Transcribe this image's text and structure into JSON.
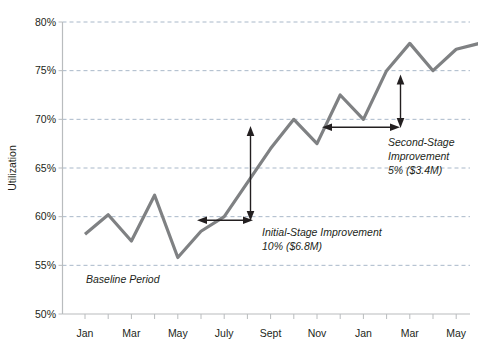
{
  "chart_data": {
    "type": "line",
    "title": "",
    "xlabel": "",
    "ylabel": "Utilization",
    "ylim": [
      50,
      80
    ],
    "ytick_labels": [
      "80%",
      "75%",
      "70%",
      "65%",
      "60%",
      "55%",
      "50%"
    ],
    "ytick_values": [
      80,
      75,
      70,
      65,
      60,
      55,
      50
    ],
    "grid": true,
    "grid_axis": "y",
    "legend": "none",
    "x": [
      "Jan",
      "Feb",
      "Mar",
      "Apr",
      "May",
      "June",
      "July",
      "Aug",
      "Sept",
      "Oct",
      "Nov",
      "Dec",
      "Jan",
      "Feb",
      "Mar",
      "Apr",
      "May",
      "June"
    ],
    "xtick_labels": [
      "Jan",
      "Mar",
      "May",
      "July",
      "Sept",
      "Nov",
      "Jan",
      "Mar",
      "May"
    ],
    "xtick_indices": [
      0,
      2,
      4,
      6,
      8,
      10,
      12,
      14,
      16
    ],
    "series": [
      {
        "name": "Utilization",
        "color": "#7f8183",
        "values": [
          58.2,
          60.2,
          57.5,
          62.2,
          55.8,
          58.5,
          60.0,
          63.5,
          67.0,
          70.0,
          67.5,
          72.5,
          70.0,
          75.0,
          77.8,
          75.0,
          77.2,
          77.8
        ]
      }
    ],
    "annotations": [
      {
        "name": "baseline-period",
        "text": "Baseline Period",
        "style": "italic"
      },
      {
        "name": "initial-stage-improvement",
        "lines": [
          "Initial-Stage Improvement",
          "10% ($6.8M)"
        ],
        "delta_percent": "10%",
        "delta_value": "$6.8M",
        "from_level": 60,
        "to_level": 70
      },
      {
        "name": "second-stage-improvement",
        "lines": [
          "Second-Stage",
          "Improvement",
          "5% ($3.4M)"
        ],
        "delta_percent": "5%",
        "delta_value": "$3.4M",
        "from_level": 70,
        "to_level": 75
      }
    ],
    "colors": {
      "line": "#7f8183",
      "grid": "#a9b8c9",
      "axis": "#b9bcbe",
      "text": "#231f20",
      "background": "#ffffff"
    }
  }
}
